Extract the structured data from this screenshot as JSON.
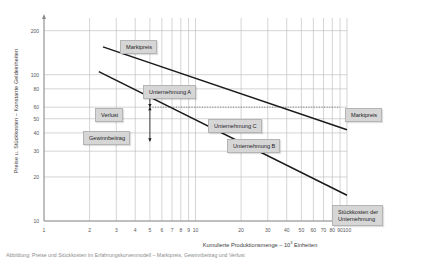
{
  "chart_data": {
    "type": "line",
    "title": "",
    "xlabel": "Kumulierte Produktionsmenge – 10³ Einheiten",
    "xlabel_prefix": "Kumulierte Produktionsmenge – 10",
    "xlabel_exp": "3",
    "xlabel_suffix": " Einheiten",
    "ylabel": "Preise u. Stückkosten – Konstante Geldeinheiten",
    "xscale": "log",
    "yscale": "log",
    "xlim": [
      1,
      100
    ],
    "ylim": [
      10,
      260
    ],
    "grid": true,
    "legend": "none",
    "xticks": [
      "1",
      "2",
      "3",
      "4",
      "5",
      "6",
      "7",
      "8",
      "9",
      "10",
      "20",
      "30",
      "40",
      "50",
      "60",
      "70",
      "80",
      "90",
      "100"
    ],
    "xtick_values": [
      1,
      2,
      3,
      4,
      5,
      6,
      7,
      8,
      9,
      10,
      20,
      30,
      40,
      50,
      60,
      70,
      80,
      90,
      100
    ],
    "yticks": [
      "200",
      "100",
      "80",
      "60",
      "50",
      "40",
      "30",
      "20",
      "10"
    ],
    "ytick_values": [
      200,
      100,
      80,
      60,
      50,
      40,
      30,
      20,
      10
    ],
    "series": [
      {
        "name": "Marktpreis",
        "points": [
          [
            2.45,
            155
          ],
          [
            100,
            42
          ]
        ],
        "style": "solid"
      },
      {
        "name": "Stückkosten der Unternehmung",
        "points": [
          [
            2.3,
            105
          ],
          [
            100,
            15
          ]
        ],
        "style": "solid"
      }
    ],
    "reference_lines": [
      {
        "name": "marktpreis-level",
        "orientation": "horizontal",
        "value": 60,
        "x_from": 5,
        "x_to": 90,
        "style": "dotted"
      }
    ],
    "annotations": [
      {
        "name": "verlust",
        "label": "Verlust",
        "x": 5,
        "y_from": 60,
        "y_to": 78,
        "arrow": "double-vertical"
      },
      {
        "name": "gewinnbeitrag",
        "label": "Gewinnbeitrag",
        "x": 5,
        "y_from": 35,
        "y_to": 60,
        "arrow": "double-vertical"
      }
    ]
  },
  "labels": {
    "marktpreis_left": "Marktpreis",
    "marktpreis_right": "Marktpreis",
    "unternehmung_a": "Unternehmung A",
    "unternehmung_b": "Unternehmung B",
    "unternehmung_c": "Unternehmung C",
    "verlust": "Verlust",
    "gewinnbeitrag": "Gewinnbeitrag",
    "stueckkosten_line1": "Stückkosten der",
    "stueckkosten_line2": "Unternehmung"
  },
  "caption": "Abbildung: Preise und Stückkosten im Erfahrungskurvenmodell – Marktpreis, Gewinnbeitrag und Verlust",
  "colors": {
    "line": "#1a1a1a",
    "grid": "#b9b9b9",
    "axis": "#8a8a8a",
    "text": "#3b3b3b",
    "plaque_face": "#d6d6d6",
    "plaque_top": "#e4e4e4"
  }
}
